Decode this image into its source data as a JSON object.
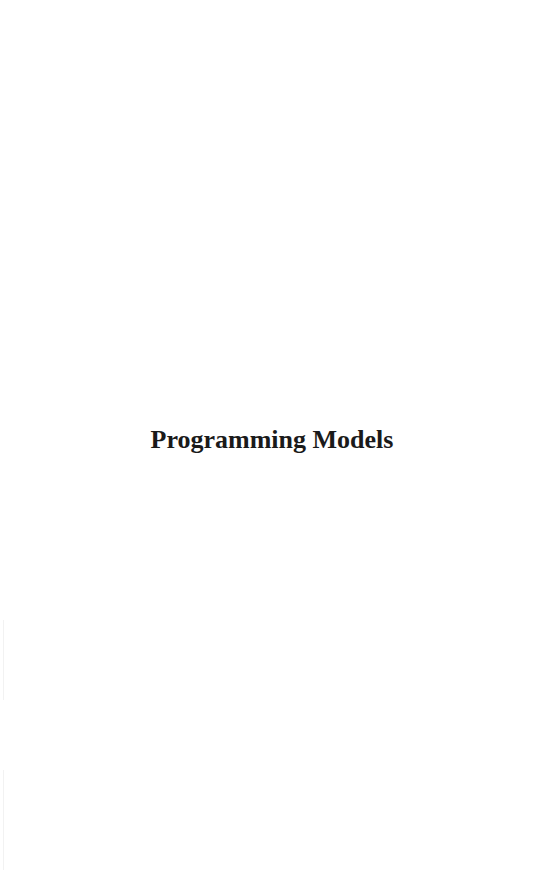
{
  "page": {
    "title": "Programming Models"
  }
}
